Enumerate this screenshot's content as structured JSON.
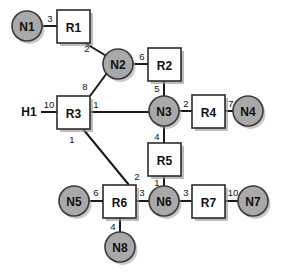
{
  "diagram": {
    "type": "network-topology",
    "title": "",
    "colors": {
      "node_fill": "#a9a9a9",
      "router_fill": "#ffffff",
      "stroke": "#1a1a1a",
      "background": "#ffffff",
      "shadow": "#9a9a9a"
    },
    "hosts": [
      {
        "id": "H1",
        "label": "H1",
        "x": 29,
        "y": 112
      }
    ],
    "nodes": [
      {
        "id": "N1",
        "label": "N1",
        "cx": 27,
        "cy": 26,
        "r": 15
      },
      {
        "id": "N2",
        "label": "N2",
        "cx": 118,
        "cy": 64,
        "r": 15
      },
      {
        "id": "N3",
        "label": "N3",
        "cx": 164,
        "cy": 111,
        "r": 15
      },
      {
        "id": "N4",
        "label": "N4",
        "cx": 248,
        "cy": 111,
        "r": 15
      },
      {
        "id": "N5",
        "label": "N5",
        "cx": 74,
        "cy": 201,
        "r": 15
      },
      {
        "id": "N6",
        "label": "N6",
        "cx": 164,
        "cy": 201,
        "r": 15
      },
      {
        "id": "N7",
        "label": "N7",
        "cx": 253,
        "cy": 201,
        "r": 15
      },
      {
        "id": "N8",
        "label": "N8",
        "cx": 120,
        "cy": 247,
        "r": 15
      }
    ],
    "routers": [
      {
        "id": "R1",
        "label": "R1",
        "x": 57,
        "y": 10,
        "w": 33,
        "h": 33
      },
      {
        "id": "R2",
        "label": "R2",
        "x": 148,
        "y": 48,
        "w": 33,
        "h": 33
      },
      {
        "id": "R3",
        "label": "R3",
        "x": 57,
        "y": 96,
        "w": 33,
        "h": 33
      },
      {
        "id": "R4",
        "label": "R4",
        "x": 192,
        "y": 95,
        "w": 33,
        "h": 33
      },
      {
        "id": "R5",
        "label": "R5",
        "x": 148,
        "y": 143,
        "w": 33,
        "h": 33
      },
      {
        "id": "R6",
        "label": "R6",
        "x": 103,
        "y": 185,
        "w": 33,
        "h": 33
      },
      {
        "id": "R7",
        "label": "R7",
        "x": 192,
        "y": 185,
        "w": 33,
        "h": 33
      }
    ],
    "links": [
      {
        "id": "N1-R1",
        "from": "N1",
        "to": "R1",
        "x1": 42,
        "y1": 26,
        "x2": 57,
        "y2": 26
      },
      {
        "id": "R1-N2",
        "from": "R1",
        "to": "N2",
        "x1": 85,
        "y1": 43,
        "x2": 108,
        "y2": 57
      },
      {
        "id": "N2-R2",
        "from": "N2",
        "to": "R2",
        "x1": 133,
        "y1": 64,
        "x2": 148,
        "y2": 64
      },
      {
        "id": "R2-N3",
        "from": "R2",
        "to": "N3",
        "x1": 164,
        "y1": 81,
        "x2": 164,
        "y2": 96
      },
      {
        "id": "N2-R3",
        "from": "N2",
        "to": "R3",
        "x1": 107,
        "y1": 73,
        "x2": 90,
        "y2": 96
      },
      {
        "id": "H1-R3",
        "from": "H1",
        "to": "R3",
        "x1": 41,
        "y1": 112,
        "x2": 57,
        "y2": 112
      },
      {
        "id": "R3-N3",
        "from": "R3",
        "to": "N3",
        "x1": 90,
        "y1": 112,
        "x2": 149,
        "y2": 112
      },
      {
        "id": "N3-R4",
        "from": "N3",
        "to": "R4",
        "x1": 179,
        "y1": 111,
        "x2": 192,
        "y2": 111
      },
      {
        "id": "R4-N4",
        "from": "R4",
        "to": "N4",
        "x1": 225,
        "y1": 111,
        "x2": 233,
        "y2": 111
      },
      {
        "id": "N3-R5",
        "from": "N3",
        "to": "R5",
        "x1": 164,
        "y1": 126,
        "x2": 164,
        "y2": 143
      },
      {
        "id": "R5-N6",
        "from": "R5",
        "to": "N6",
        "x1": 164,
        "y1": 176,
        "x2": 164,
        "y2": 186
      },
      {
        "id": "R3-R6",
        "from": "R3",
        "to": "R6",
        "x1": 83,
        "y1": 129,
        "x2": 129,
        "y2": 185
      },
      {
        "id": "N5-R6",
        "from": "N5",
        "to": "R6",
        "x1": 89,
        "y1": 201,
        "x2": 103,
        "y2": 201
      },
      {
        "id": "R6-N6",
        "from": "R6",
        "to": "N6",
        "x1": 136,
        "y1": 201,
        "x2": 149,
        "y2": 201
      },
      {
        "id": "R6-N8",
        "from": "R6",
        "to": "N8",
        "x1": 120,
        "y1": 218,
        "x2": 120,
        "y2": 232
      },
      {
        "id": "N6-R7",
        "from": "N6",
        "to": "R7",
        "x1": 179,
        "y1": 201,
        "x2": 192,
        "y2": 201
      },
      {
        "id": "R7-N7",
        "from": "R7",
        "to": "N7",
        "x1": 225,
        "y1": 201,
        "x2": 238,
        "y2": 201
      }
    ],
    "port_labels": [
      {
        "id": "p-r1-3",
        "text": "3",
        "x": 50,
        "y": 18,
        "link": "N1-R1"
      },
      {
        "id": "p-r1-2",
        "text": "2",
        "x": 87,
        "y": 48,
        "link": "R1-N2"
      },
      {
        "id": "p-r2-6",
        "text": "6",
        "x": 142,
        "y": 56,
        "link": "N2-R2"
      },
      {
        "id": "p-r2-5",
        "text": "5",
        "x": 157,
        "y": 88,
        "link": "R2-N3"
      },
      {
        "id": "p-r3-8",
        "text": "8",
        "x": 85,
        "y": 86,
        "link": "N2-R3"
      },
      {
        "id": "p-r3-10",
        "text": "10",
        "x": 49,
        "y": 104,
        "link": "H1-R3"
      },
      {
        "id": "p-r3-1",
        "text": "1",
        "x": 96,
        "y": 104,
        "link": "R3-N3"
      },
      {
        "id": "p-r4-2",
        "text": "2",
        "x": 186,
        "y": 103,
        "link": "N3-R4"
      },
      {
        "id": "p-r4-7",
        "text": "7",
        "x": 231,
        "y": 103,
        "link": "R4-N4"
      },
      {
        "id": "p-r5-4",
        "text": "4",
        "x": 157,
        "y": 136,
        "link": "N3-R5"
      },
      {
        "id": "p-r3-1b",
        "text": "1",
        "x": 72,
        "y": 139,
        "link": "R3-R6"
      },
      {
        "id": "p-r6-2",
        "text": "2",
        "x": 137,
        "y": 176,
        "link": "R3-R6"
      },
      {
        "id": "p-r5-1",
        "text": "1",
        "x": 157,
        "y": 182,
        "link": "R5-N6"
      },
      {
        "id": "p-r6-6",
        "text": "6",
        "x": 96,
        "y": 192,
        "link": "N5-R6"
      },
      {
        "id": "p-r6-3",
        "text": "3",
        "x": 142,
        "y": 192,
        "link": "R6-N6"
      },
      {
        "id": "p-r7-3",
        "text": "3",
        "x": 186,
        "y": 192,
        "link": "N6-R7"
      },
      {
        "id": "p-r7-10",
        "text": "10",
        "x": 233,
        "y": 192,
        "link": "R7-N7"
      },
      {
        "id": "p-r6-4",
        "text": "4",
        "x": 113,
        "y": 226,
        "link": "R6-N8"
      }
    ]
  }
}
